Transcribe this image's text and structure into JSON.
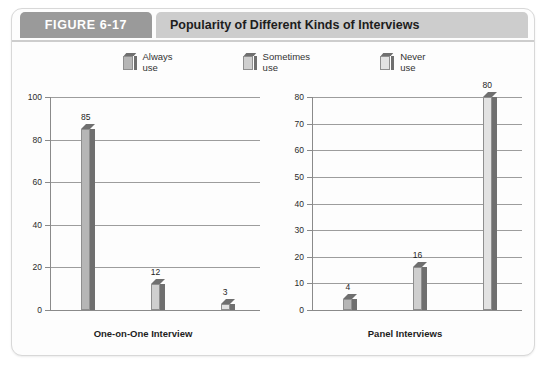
{
  "figure": {
    "tag": "FIGURE 6-17",
    "title": "Popularity of Different Kinds of Interviews"
  },
  "legend": {
    "items": [
      {
        "label": "Always\nuse",
        "color": "#b6b6b6"
      },
      {
        "label": "Sometimes\nuse",
        "color": "#cfcfcf"
      },
      {
        "label": "Never\nuse",
        "color": "#e2e2e2"
      }
    ]
  },
  "colors": {
    "tag_bg": "#9a9a9a",
    "titlebar_bg": "#cdcdcd",
    "card_bg": "#fdfdfd",
    "axis": "#8a8a8a",
    "grid": "#9d9d9d",
    "bar_dark": "#6f6f6f"
  },
  "chart_data": [
    {
      "type": "bar",
      "title": "One-on-One Interview",
      "xlabel": "One-on-One Interview",
      "ylabel": "",
      "ylim": [
        0,
        100
      ],
      "yticks": [
        0,
        20,
        40,
        60,
        80,
        100
      ],
      "grid": true,
      "legend_position": "top-center",
      "categories": [
        "Always use",
        "Sometimes use",
        "Never use"
      ],
      "values": [
        85,
        12,
        3
      ],
      "labels": [
        "85",
        "12",
        "3"
      ]
    },
    {
      "type": "bar",
      "title": "Panel Interviews",
      "xlabel": "Panel Interviews",
      "ylabel": "",
      "ylim": [
        0,
        80
      ],
      "yticks": [
        0,
        10,
        20,
        30,
        40,
        50,
        60,
        70,
        80
      ],
      "grid": true,
      "legend_position": "top-center",
      "categories": [
        "Always use",
        "Sometimes use",
        "Never use"
      ],
      "values": [
        4,
        16,
        80
      ],
      "labels": [
        "4",
        "16",
        "80"
      ]
    }
  ]
}
